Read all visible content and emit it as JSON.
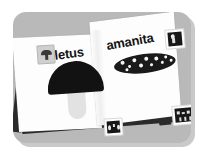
{
  "scene": {
    "title": "open field guide book illustration",
    "panel_color": "#b9b9b9",
    "page_color": "#fdfdfd",
    "ink_color": "#141414",
    "background_color": "#ffffff"
  },
  "book": {
    "left_page": {
      "label": "boletus",
      "illustration": {
        "name": "boletus-mushroom",
        "cap_color": "#121212",
        "stem_color": "#e2e2e2"
      }
    },
    "right_page": {
      "label": "amanita",
      "illustration": {
        "name": "amanita-mushroom",
        "body_color": "#1a1a1a",
        "spot_color": "#f5f5f5",
        "spot_count": 11
      }
    }
  },
  "thumbnails": [
    {
      "name": "mushroom-thumb-icon",
      "position": "top-left",
      "style": "light"
    },
    {
      "name": "specimen-photo-icon",
      "position": "top-right",
      "style": "dark"
    },
    {
      "name": "specimen-photo-icon",
      "position": "bottom-center",
      "style": "dark"
    },
    {
      "name": "specimen-photo-icon",
      "position": "bottom-right",
      "style": "dark"
    }
  ]
}
